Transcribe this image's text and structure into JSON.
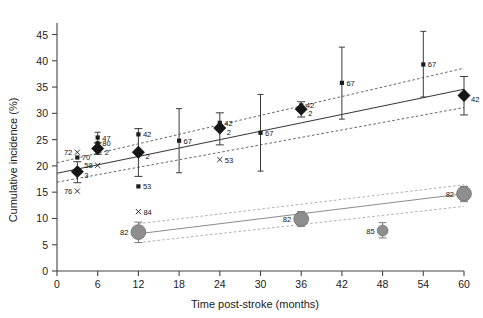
{
  "chart_data": {
    "type": "scatter",
    "title": "",
    "xlabel": "Time post-stroke (months)",
    "ylabel": "Cumulative incidence (%)",
    "xlim": [
      0,
      60
    ],
    "ylim": [
      0,
      47
    ],
    "xticks": [
      0,
      6,
      12,
      18,
      24,
      30,
      36,
      42,
      48,
      54,
      60
    ],
    "yticks": [
      0,
      5,
      10,
      15,
      20,
      25,
      30,
      35,
      40,
      45
    ],
    "grid": false,
    "legend": "none",
    "series": [
      {
        "name": "pooled-estimate-dark",
        "marker": "diamond",
        "color": "#161616",
        "points": [
          {
            "x": 3,
            "y": 18.9,
            "lo": 16.8,
            "hi": 20.8,
            "label": "3"
          },
          {
            "x": 6,
            "y": 23.3,
            "lo": 22.2,
            "hi": 24.4,
            "label": "2"
          },
          {
            "x": 12,
            "y": 22.6,
            "lo": 18.0,
            "hi": 27.1,
            "label": "2"
          },
          {
            "x": 24,
            "y": 27.2,
            "lo": 24.0,
            "hi": 30.1,
            "label": "2"
          },
          {
            "x": 36,
            "y": 30.8,
            "lo": 29.3,
            "hi": 32.2,
            "label": "2"
          },
          {
            "x": 60,
            "y": 33.4,
            "lo": 29.7,
            "hi": 37.0,
            "label": "42"
          }
        ]
      },
      {
        "name": "individual-studies-dark",
        "marker": "square",
        "color": "#1b1b1b",
        "points": [
          {
            "x": 3,
            "y": 21.6,
            "label": "70"
          },
          {
            "x": 6,
            "y": 25.4,
            "lo": 24.3,
            "hi": 26.4,
            "label": "47"
          },
          {
            "x": 6,
            "y": 24.3,
            "label": "80"
          },
          {
            "x": 12,
            "y": 26.0,
            "label": "42"
          },
          {
            "x": 12,
            "y": 16.1,
            "label": "53"
          },
          {
            "x": 18,
            "y": 24.8,
            "lo": 18.7,
            "hi": 30.9,
            "label": "67"
          },
          {
            "x": 24,
            "y": 28.2,
            "label": "42"
          },
          {
            "x": 30,
            "y": 26.3,
            "lo": 19.0,
            "hi": 33.6,
            "label": "67"
          },
          {
            "x": 36,
            "y": 31.5,
            "label": "42"
          },
          {
            "x": 42,
            "y": 35.8,
            "lo": 28.9,
            "hi": 42.6,
            "label": "67"
          },
          {
            "x": 54,
            "y": 39.3,
            "lo": 33.1,
            "hi": 45.6,
            "label": "67"
          }
        ]
      },
      {
        "name": "x-markers-dark",
        "marker": "x",
        "color": "#1b1b1b",
        "points": [
          {
            "x": 3,
            "y": 22.6,
            "label": "72"
          },
          {
            "x": 3,
            "y": 15.2,
            "label": "76"
          },
          {
            "x": 6,
            "y": 20.1,
            "label": "58"
          },
          {
            "x": 24,
            "y": 21.2,
            "label": "53"
          },
          {
            "x": 12,
            "y": 11.3,
            "label": "84"
          }
        ]
      },
      {
        "name": "pooled-estimate-grey",
        "marker": "circle",
        "color": "#8e8e8e",
        "points": [
          {
            "x": 12,
            "y": 7.4,
            "lo": 5.4,
            "hi": 9.3,
            "label": "82"
          },
          {
            "x": 36,
            "y": 9.9,
            "lo": 8.5,
            "hi": 11.3,
            "label": "82"
          },
          {
            "x": 48,
            "y": 7.7,
            "lo": 6.3,
            "hi": 9.2,
            "label": "85"
          },
          {
            "x": 60,
            "y": 14.7,
            "lo": 13.2,
            "hi": 16.1,
            "label": "82"
          }
        ]
      }
    ],
    "trendlines": [
      {
        "name": "dark-fit",
        "style": "solid",
        "x": [
          0,
          60
        ],
        "y": [
          18.6,
          34.6
        ]
      },
      {
        "name": "dark-ci-upper",
        "style": "dashed",
        "x": [
          0,
          60
        ],
        "y": [
          20.6,
          38.6
        ]
      },
      {
        "name": "dark-ci-lower",
        "style": "dashed",
        "x": [
          0,
          60
        ],
        "y": [
          16.9,
          31.1
        ]
      },
      {
        "name": "grey-fit",
        "style": "solid",
        "x": [
          12,
          60
        ],
        "y": [
          7.1,
          14.7
        ]
      },
      {
        "name": "grey-ci-upper",
        "style": "dashed",
        "x": [
          12,
          60
        ],
        "y": [
          9.0,
          16.4
        ]
      },
      {
        "name": "grey-ci-lower",
        "style": "dashed",
        "x": [
          12,
          60
        ],
        "y": [
          5.4,
          12.3
        ]
      }
    ],
    "annotations": {
      "left_cluster_labels": [
        "72",
        "70",
        "3",
        "58",
        "76"
      ]
    }
  }
}
